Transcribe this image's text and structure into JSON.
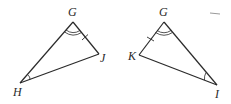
{
  "diagram": {
    "type": "geometry-congruent-triangles",
    "stroke_color": "#2a2a2a",
    "triangles": [
      {
        "name": "triangle-GHJ",
        "vertices": {
          "G": {
            "label": "G",
            "x": 73,
            "y": 22
          },
          "J": {
            "label": "J",
            "x": 99,
            "y": 54
          },
          "H": {
            "label": "H",
            "x": 20,
            "y": 83
          }
        },
        "marks": {
          "angle_G": "double-arc",
          "angle_H": "single-arc",
          "side_GJ": "single-tick"
        }
      },
      {
        "name": "triangle-GKI",
        "vertices": {
          "G": {
            "label": "G",
            "x": 164,
            "y": 22
          },
          "K": {
            "label": "K",
            "x": 139,
            "y": 55
          },
          "I": {
            "label": "I",
            "x": 217,
            "y": 85
          }
        },
        "marks": {
          "angle_G": "double-arc",
          "angle_I": "single-arc",
          "side_GK": "single-tick"
        }
      }
    ],
    "labels": {
      "left_G": "G",
      "left_J": "J",
      "left_H": "H",
      "right_G": "G",
      "right_K": "K",
      "right_I": "I"
    }
  }
}
